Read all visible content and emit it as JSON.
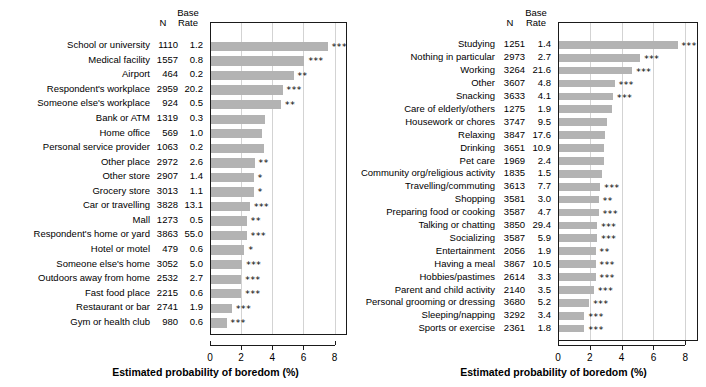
{
  "chart_data": [
    {
      "type": "bar",
      "panel": "left",
      "title": "",
      "xlabel": "Estimated probability of boredom (%)",
      "ylabel": "",
      "xlim": [
        0,
        8.8
      ],
      "xticks": [
        0,
        2,
        4,
        6,
        8
      ],
      "grid": true,
      "orientation": "horizontal",
      "columns": [
        "N",
        "Base\nRate",
        "Estimated probability of boredom (%)"
      ],
      "col_n_header": "N",
      "col_base_header": "Base\nRate",
      "categories": [
        "School or university",
        "Medical facility",
        "Airport",
        "Respondent's workplace",
        "Someone else's workplace",
        "Bank or ATM",
        "Home office",
        "Personal service provider",
        "Other place",
        "Other store",
        "Grocery store",
        "Car or travelling",
        "Mall",
        "Respondent's home or yard",
        "Hotel or motel",
        "Someone else's home",
        "Outdoors away from home",
        "Fast food place",
        "Restaurant or bar",
        "Gym or health club"
      ],
      "n": [
        1110,
        1557,
        464,
        2959,
        924,
        1319,
        569,
        1063,
        2972,
        2907,
        3013,
        3828,
        1273,
        3863,
        479,
        3052,
        2532,
        2215,
        2741,
        980
      ],
      "base_rate": [
        1.2,
        0.8,
        0.2,
        20.2,
        0.5,
        0.3,
        1.0,
        0.2,
        2.6,
        1.4,
        1.1,
        13.1,
        0.5,
        55.0,
        0.6,
        5.0,
        2.7,
        0.6,
        1.9,
        0.6
      ],
      "values": [
        7.5,
        6.0,
        5.3,
        4.6,
        4.5,
        3.5,
        3.3,
        3.4,
        2.8,
        2.75,
        2.75,
        2.5,
        2.3,
        2.3,
        2.15,
        2.0,
        1.95,
        1.95,
        1.35,
        1.0
      ],
      "significance": [
        "***",
        "***",
        "**",
        "***",
        "**",
        "",
        "",
        "",
        "**",
        "*",
        "*",
        "***",
        "**",
        "***",
        "*",
        "***",
        "***",
        "***",
        "***",
        "***"
      ]
    },
    {
      "type": "bar",
      "panel": "right",
      "title": "",
      "xlabel": "Estimated probability of boredom (%)",
      "ylabel": "",
      "xlim": [
        0,
        8.8
      ],
      "xticks": [
        0,
        2,
        4,
        6,
        8
      ],
      "grid": true,
      "orientation": "horizontal",
      "columns": [
        "N",
        "Base\nRate",
        "Estimated probability of boredom (%)"
      ],
      "col_n_header": "N",
      "col_base_header": "Base\nRate",
      "categories": [
        "Studying",
        "Nothing in particular",
        "Working",
        "Other",
        "Snacking",
        "Care of elderly/others",
        "Housework or chores",
        "Relaxing",
        "Drinking",
        "Pet care",
        "Community org/religious activity",
        "Travelling/commuting",
        "Shopping",
        "Preparing food or cooking",
        "Talking or chatting",
        "Socializing",
        "Entertainment",
        "Having a meal",
        "Hobbies/pastimes",
        "Parent and child activity",
        "Personal grooming or dressing",
        "Sleeping/napping",
        "Sports or exercise"
      ],
      "n": [
        1251,
        2973,
        3264,
        3607,
        3633,
        1275,
        3747,
        3847,
        3651,
        1969,
        1835,
        3613,
        3581,
        3587,
        3850,
        3587,
        2056,
        3867,
        2614,
        2140,
        3680,
        3292,
        2361
      ],
      "base_rate": [
        1.4,
        2.7,
        21.6,
        4.8,
        4.1,
        1.9,
        9.5,
        17.6,
        10.9,
        2.4,
        1.5,
        7.7,
        3.0,
        4.7,
        29.4,
        5.9,
        1.9,
        10.5,
        3.3,
        3.5,
        5.2,
        3.4,
        1.8
      ],
      "values": [
        7.45,
        5.1,
        4.6,
        3.5,
        3.4,
        3.3,
        3.0,
        2.9,
        2.85,
        2.8,
        2.7,
        2.6,
        2.5,
        2.5,
        2.4,
        2.4,
        2.3,
        2.3,
        2.3,
        2.2,
        1.9,
        1.6,
        1.6
      ],
      "significance": [
        "***",
        "***",
        "***",
        "***",
        "***",
        "",
        "",
        "",
        "",
        "",
        "",
        "***",
        "**",
        "***",
        "***",
        "***",
        "**",
        "***",
        "***",
        "***",
        "***",
        "***",
        "***"
      ]
    }
  ]
}
